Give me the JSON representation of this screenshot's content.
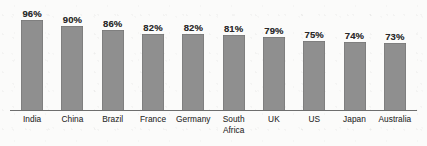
{
  "chart_data": {
    "type": "bar",
    "title": "",
    "subtitle": "",
    "xlabel": "",
    "ylabel": "",
    "ylim": [
      0,
      100
    ],
    "grid": false,
    "legend": false,
    "value_suffix": "%",
    "categories": [
      "India",
      "China",
      "Brazil",
      "France",
      "Germany",
      "South Africa",
      "UK",
      "US",
      "Japan",
      "Australia"
    ],
    "category_lines": [
      [
        "India"
      ],
      [
        "China"
      ],
      [
        "Brazil"
      ],
      [
        "France"
      ],
      [
        "Germany"
      ],
      [
        "South",
        "Africa"
      ],
      [
        "UK"
      ],
      [
        "US"
      ],
      [
        "Japan"
      ],
      [
        "Australia"
      ]
    ],
    "values": [
      96,
      90,
      86,
      82,
      82,
      81,
      79,
      75,
      74,
      73
    ],
    "value_labels": [
      "96%",
      "90%",
      "86%",
      "82%",
      "82%",
      "81%",
      "79%",
      "75%",
      "74%",
      "73%"
    ],
    "colors": {
      "bar_fill": "#8f8f8f",
      "axis_line": "#6e6e6e",
      "value_text": "#2a2a2a",
      "category_text": "#303030",
      "background": "#fbfbfa"
    }
  }
}
